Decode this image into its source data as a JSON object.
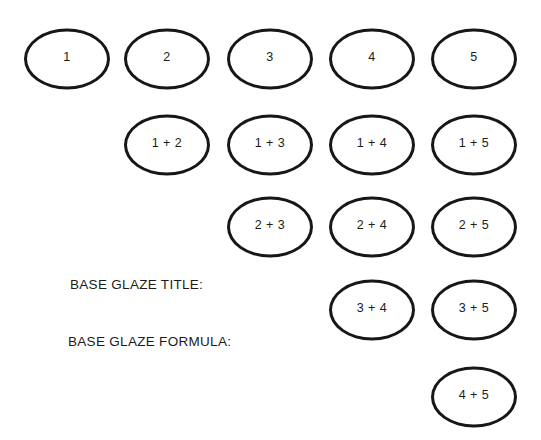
{
  "diagram": {
    "type": "glaze-blend-chart",
    "colors": {
      "stroke": "#171717",
      "text": "#1c1c1c",
      "background": "#ffffff"
    },
    "labels": {
      "title": "BASE GLAZE TITLE:",
      "formula": "BASE GLAZE FORMULA:"
    },
    "ovals": [
      {
        "label": "1",
        "row": 0,
        "col": 0
      },
      {
        "label": "2",
        "row": 0,
        "col": 1
      },
      {
        "label": "3",
        "row": 0,
        "col": 2
      },
      {
        "label": "4",
        "row": 0,
        "col": 3
      },
      {
        "label": "5",
        "row": 0,
        "col": 4
      },
      {
        "label": "1 + 2",
        "row": 1,
        "col": 1
      },
      {
        "label": "1 + 3",
        "row": 1,
        "col": 2
      },
      {
        "label": "1 + 4",
        "row": 1,
        "col": 3
      },
      {
        "label": "1 + 5",
        "row": 1,
        "col": 4
      },
      {
        "label": "2 + 3",
        "row": 2,
        "col": 2
      },
      {
        "label": "2 + 4",
        "row": 2,
        "col": 3
      },
      {
        "label": "2 + 5",
        "row": 2,
        "col": 4
      },
      {
        "label": "3 + 4",
        "row": 3,
        "col": 3
      },
      {
        "label": "3 + 5",
        "row": 3,
        "col": 4
      },
      {
        "label": "4 + 5",
        "row": 4,
        "col": 4
      }
    ]
  }
}
